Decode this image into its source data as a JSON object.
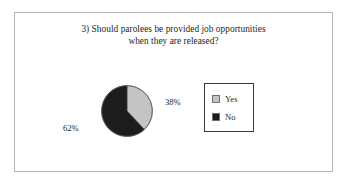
{
  "figure": {
    "title_lines": [
      "3) Should parolees be provided job opportunities",
      "when they are released?"
    ],
    "frame_color": "#b5b5b5",
    "background": "#ffffff"
  },
  "legend": {
    "items": [
      {
        "label": "Yes",
        "color": "#c4c4c4",
        "swatch_name": "legend-swatch-yes"
      },
      {
        "label": "No",
        "color": "#1c1c1c",
        "swatch_name": "legend-swatch-no"
      }
    ]
  },
  "labels": {
    "yes_percent": "38%",
    "no_percent": "62%"
  },
  "chart_data": {
    "type": "pie",
    "title": "3) Should parolees be provided job opportunities when they are released?",
    "categories": [
      "Yes",
      "No"
    ],
    "values": [
      38,
      62
    ],
    "value_labels": [
      "38%",
      "62%"
    ],
    "colors": [
      "#c4c4c4",
      "#1c1c1c"
    ],
    "units": "percent",
    "start_angle_deg": 0,
    "direction": "clockwise",
    "legend_position": "right",
    "grid": false,
    "xlabel": "",
    "ylabel": ""
  }
}
